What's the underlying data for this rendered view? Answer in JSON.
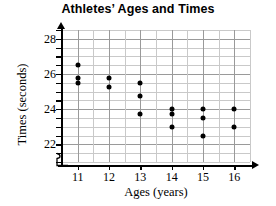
{
  "chart_data": {
    "type": "scatter",
    "title": "Athletes’ Ages and Times",
    "xlabel": "Ages (years)",
    "ylabel": "Times (seconds)",
    "xlim": [
      10.5,
      16.5
    ],
    "ylim": [
      21.0,
      28.5
    ],
    "grid": true,
    "x_major_ticks": [
      11,
      12,
      13,
      14,
      15,
      16
    ],
    "y_major_ticks": [
      22,
      24,
      26,
      28
    ],
    "y_minor_step": 0.5,
    "legend": "none",
    "marker": "filled-circle",
    "marker_color": "#000000",
    "points": [
      {
        "age": 11,
        "time": 26.5
      },
      {
        "age": 11,
        "time": 25.75
      },
      {
        "age": 11,
        "time": 25.5
      },
      {
        "age": 12,
        "time": 25.75
      },
      {
        "age": 12,
        "time": 25.25
      },
      {
        "age": 13,
        "time": 25.5
      },
      {
        "age": 13,
        "time": 24.75
      },
      {
        "age": 13,
        "time": 23.75
      },
      {
        "age": 14,
        "time": 24.0
      },
      {
        "age": 14,
        "time": 23.75
      },
      {
        "age": 14,
        "time": 23.0
      },
      {
        "age": 15,
        "time": 24.0
      },
      {
        "age": 15,
        "time": 23.5
      },
      {
        "age": 15,
        "time": 22.5
      },
      {
        "age": 16,
        "time": 24.0
      },
      {
        "age": 16,
        "time": 23.0
      }
    ]
  },
  "axis": {
    "y_tick_labels": [
      "28",
      "26",
      "24",
      "22"
    ],
    "x_tick_labels": [
      "11",
      "12",
      "13",
      "14",
      "15",
      "16"
    ]
  }
}
